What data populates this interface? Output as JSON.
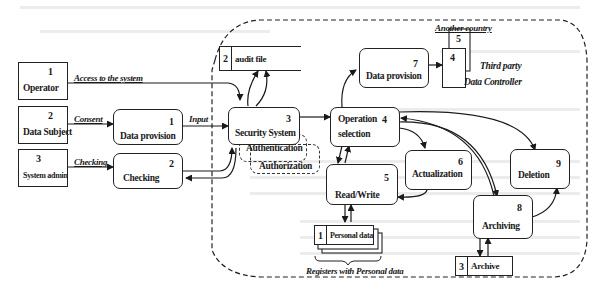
{
  "diagram": {
    "type": "data-flow-diagram",
    "external_entities": [
      {
        "id": "1",
        "label": "Operator"
      },
      {
        "id": "2",
        "label": "Data Subject"
      },
      {
        "id": "3",
        "label": "System admin"
      }
    ],
    "processes": [
      {
        "id": "1",
        "label": "Data provision"
      },
      {
        "id": "2",
        "label": "Checking"
      },
      {
        "id": "3",
        "label": "Security System"
      },
      {
        "id": "4",
        "label_line1": "Operation",
        "label_line2": "selection"
      },
      {
        "id": "5",
        "label": "Read/Write"
      },
      {
        "id": "6",
        "label": "Actualization"
      },
      {
        "id": "7",
        "label": "Data provision"
      },
      {
        "id": "8",
        "label": "Archiving"
      },
      {
        "id": "9",
        "label": "Deletion"
      }
    ],
    "security_subsystems": [
      {
        "label": "Authentication"
      },
      {
        "label": "Authorization"
      }
    ],
    "data_stores": [
      {
        "id": "1",
        "label": "Personal data"
      },
      {
        "id": "2",
        "label": "audit file"
      },
      {
        "id": "3",
        "label": "Archive"
      }
    ],
    "data_controllers": [
      {
        "id": "4",
        "label_line1": "Third party",
        "label_line2": "Data Controller"
      },
      {
        "id": "5",
        "label": "Another country"
      }
    ],
    "flows": [
      {
        "from": "Operator",
        "to": "Security System",
        "label": "Access to the system"
      },
      {
        "from": "Data Subject",
        "to": "Data provision 1",
        "label": "Consent"
      },
      {
        "from": "System admin",
        "to": "Checking",
        "label": "Checking"
      },
      {
        "from": "Data provision 1",
        "to": "Security System",
        "label": "Input"
      }
    ],
    "annotations": {
      "registers_label": "Registers with Personal data"
    }
  }
}
